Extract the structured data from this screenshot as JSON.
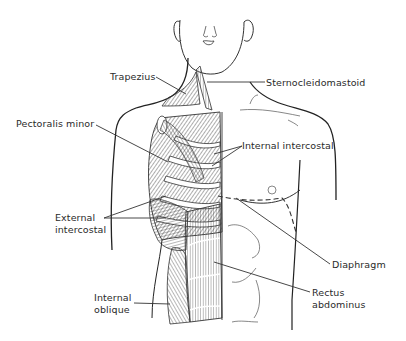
{
  "figure": {
    "labels": [
      {
        "id": "trapezius",
        "lines": [
          "Trapezius"
        ]
      },
      {
        "id": "sternocleidomastoid",
        "lines": [
          "Sternocleidomastoid"
        ]
      },
      {
        "id": "pectoralis-minor",
        "lines": [
          "Pectoralis minor"
        ]
      },
      {
        "id": "internal-intercostal",
        "lines": [
          "Internal intercostal"
        ]
      },
      {
        "id": "external-intercostal",
        "lines": [
          "External",
          "intercostal"
        ]
      },
      {
        "id": "diaphragm",
        "lines": [
          "Diaphragm"
        ]
      },
      {
        "id": "rectus-abdominus",
        "lines": [
          "Rectus",
          "abdominus"
        ]
      },
      {
        "id": "internal-oblique",
        "lines": [
          "Internal",
          "oblique"
        ]
      }
    ],
    "colors": {
      "line": "#2a2a2a",
      "background": "#ffffff"
    }
  }
}
